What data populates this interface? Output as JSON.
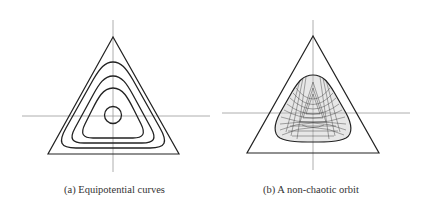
{
  "figures": [
    {
      "id": "a",
      "caption": "(a) Equipotential curves",
      "content": "Equilateral triangle with nested rounded-triangular equipotential level curves around the origin, plus crossing x/y axes",
      "level_curves": 5
    },
    {
      "id": "b",
      "caption": "(b) A non-chaotic orbit",
      "content": "Equilateral triangle containing a dense quasi-periodic orbit filling a rounded-triangular region, plus crossing x/y axes"
    }
  ],
  "colors": {
    "stroke": "#222222",
    "axis": "#888888",
    "background": "#ffffff"
  }
}
